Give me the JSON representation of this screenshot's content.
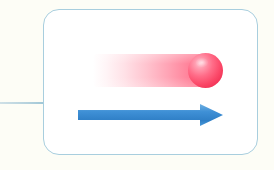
{
  "figure": {
    "background_color": "#fdfdf6",
    "frame": {
      "shape": "rounded-rectangle",
      "border_color": "#a8cede",
      "fill_color": "#ffffff",
      "corner_radius": 16,
      "x": 43,
      "y": 9,
      "width": 215,
      "height": 146
    },
    "connector": {
      "orientation": "horizontal",
      "color": "#b6d2dd",
      "x": 0,
      "y": 102,
      "length": 45
    },
    "elements": [
      {
        "name": "sphere",
        "label": "red ball",
        "color": "#fb4868",
        "highlight_color": "#ffc3cf",
        "center_x": 205,
        "center_y": 70,
        "radius": 17
      },
      {
        "name": "motion-trail",
        "label": "motion blur streak",
        "color": "#ff4669",
        "direction": "left-fade",
        "x": 93,
        "y": 54,
        "width": 112,
        "height": 33
      },
      {
        "name": "direction-arrow",
        "label": "direction of motion arrow",
        "color": "#3d8fd4",
        "points_to": "right",
        "x": 78,
        "y": 104,
        "width": 145,
        "height": 22
      }
    ]
  }
}
